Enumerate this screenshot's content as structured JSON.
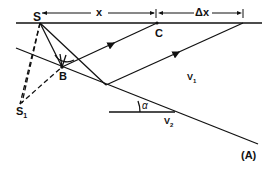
{
  "diagram": {
    "labels": {
      "source": "S",
      "image_source": "S",
      "image_source_sub": "1",
      "reflection_point": "B",
      "point_c": "C",
      "offset": "x",
      "offset_increment": "Δx",
      "velocity_upper": "V",
      "velocity_upper_sub": "1",
      "velocity_lower": "V",
      "velocity_lower_sub": "2",
      "dip_angle": "α",
      "panel": "(A)"
    },
    "colors": {
      "line": "#111111",
      "background": "#ffffff"
    }
  }
}
